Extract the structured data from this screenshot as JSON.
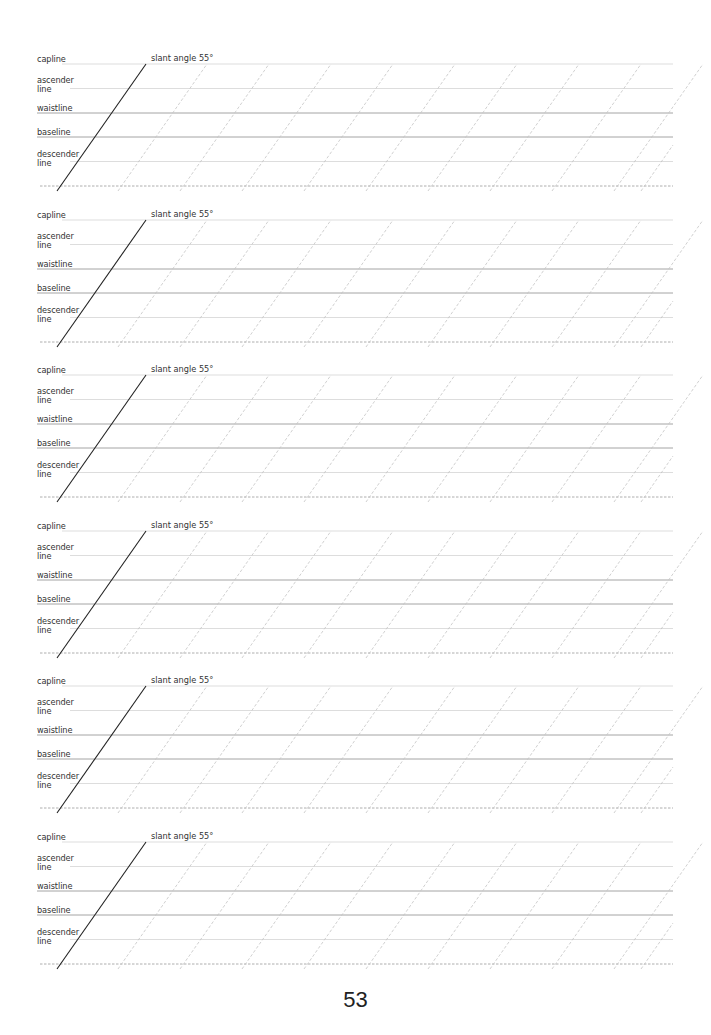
{
  "sheet": {
    "title": "Handwriting practice guide",
    "slant_label": "slant angle 55°",
    "slant_angle_deg": 55,
    "labels": {
      "capline": "capline",
      "ascender": "ascender\nline",
      "waistline": "waistline",
      "baseline": "baseline",
      "descender": "descender\nline"
    },
    "blocks": [
      {
        "index": 1,
        "capline_label": "capline",
        "ascender_label": "ascender line",
        "waistline_label": "waistline",
        "baseline_label": "baseline",
        "descender_label": "descender line",
        "slant_label": "slant angle 55°"
      },
      {
        "index": 2,
        "capline_label": "capline",
        "ascender_label": "ascender line",
        "waistline_label": "waistline",
        "baseline_label": "baseline",
        "descender_label": "descender line",
        "slant_label": "slant angle 55°"
      },
      {
        "index": 3,
        "capline_label": "capline",
        "ascender_label": "ascender line",
        "waistline_label": "waistline",
        "baseline_label": "baseline",
        "descender_label": "descender line",
        "slant_label": "slant angle 55°"
      },
      {
        "index": 4,
        "capline_label": "capline",
        "ascender_label": "ascender line",
        "waistline_label": "waistline",
        "baseline_label": "baseline",
        "descender_label": "descender line",
        "slant_label": "slant angle 55°"
      },
      {
        "index": 5,
        "capline_label": "capline",
        "ascender_label": "ascender line",
        "waistline_label": "waistline",
        "baseline_label": "baseline",
        "descender_label": "descender line",
        "slant_label": "slant angle 55°"
      },
      {
        "index": 6,
        "capline_label": "capline",
        "ascender_label": "ascender line",
        "waistline_label": "waistline",
        "baseline_label": "baseline",
        "descender_label": "descender line",
        "slant_label": "slant angle 55°"
      }
    ],
    "colors": {
      "guide_light": "#d4d4d4",
      "guide_dark": "#9a9a9a",
      "slant_solid": "#222222",
      "slant_dashed": "#c4c4c4",
      "text": "#333333"
    }
  },
  "footer": {
    "page_number": "53"
  }
}
